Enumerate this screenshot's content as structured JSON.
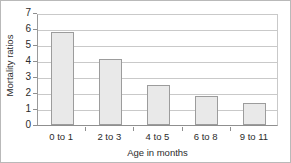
{
  "chart_data": {
    "type": "bar",
    "title": "",
    "categories": [
      "0 to 1",
      "2 to 3",
      "4 to 5",
      "6 to 8",
      "9 to 11"
    ],
    "values": [
      5.8,
      4.1,
      2.5,
      1.8,
      1.4
    ],
    "xlabel": "Age in months",
    "ylabel": "Mortality ratios",
    "ylim": [
      0,
      7
    ],
    "ytick_labels": [
      "0",
      "1",
      "2",
      "3",
      "4",
      "5",
      "6",
      "7"
    ],
    "ytick_values": [
      0,
      1,
      2,
      3,
      4,
      5,
      6,
      7
    ],
    "grid": true,
    "legend": "none",
    "bar_fill_color": "#e9e9e9",
    "bar_border_color": "#9c9c9c",
    "gridline_color": "#c9c9c9",
    "axis_color": "#8f8f8f",
    "text_color": "#2b2b2b",
    "background_color": "#ffffff"
  }
}
